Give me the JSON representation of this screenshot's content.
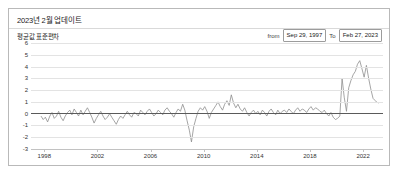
{
  "panel": {
    "title": "2023년 2월 업데이트",
    "subtitle": "평균값 표준편차"
  },
  "date_range": {
    "from_label": "from",
    "from_value": "Sep 29, 1997",
    "to_label": "To",
    "to_value": "Feb 27, 2023"
  },
  "chart_data": {
    "type": "line",
    "title": "평균값 표준편차",
    "xlabel": "",
    "ylabel": "",
    "ylim": [
      -3,
      6
    ],
    "xlim": [
      1997.0,
      2023.5
    ],
    "grid": true,
    "legend": false,
    "yticks": [
      6,
      5,
      4,
      3,
      2,
      1,
      0,
      -1,
      -2,
      -3
    ],
    "xticks": [
      1998,
      2002,
      2006,
      2010,
      2014,
      2018,
      2022
    ],
    "line_color": "#8e8e8e",
    "zero_line_color": "#5a5a5a",
    "series": [
      {
        "name": "평균값 표준편차",
        "x": [
          1997.75,
          1997.92,
          1998.08,
          1998.25,
          1998.42,
          1998.58,
          1998.75,
          1998.92,
          1999.08,
          1999.25,
          1999.42,
          1999.58,
          1999.75,
          1999.92,
          2000.08,
          2000.25,
          2000.42,
          2000.58,
          2000.75,
          2000.92,
          2001.08,
          2001.25,
          2001.42,
          2001.58,
          2001.75,
          2001.92,
          2002.08,
          2002.25,
          2002.42,
          2002.58,
          2002.75,
          2002.92,
          2003.08,
          2003.25,
          2003.42,
          2003.58,
          2003.75,
          2003.92,
          2004.08,
          2004.25,
          2004.42,
          2004.58,
          2004.75,
          2004.92,
          2005.08,
          2005.25,
          2005.42,
          2005.58,
          2005.75,
          2005.92,
          2006.08,
          2006.25,
          2006.42,
          2006.58,
          2006.75,
          2006.92,
          2007.08,
          2007.25,
          2007.42,
          2007.58,
          2007.75,
          2007.92,
          2008.08,
          2008.25,
          2008.42,
          2008.58,
          2008.75,
          2008.92,
          2009.08,
          2009.25,
          2009.42,
          2009.58,
          2009.75,
          2009.92,
          2010.08,
          2010.25,
          2010.42,
          2010.58,
          2010.75,
          2010.92,
          2011.08,
          2011.25,
          2011.42,
          2011.58,
          2011.75,
          2011.92,
          2012.08,
          2012.25,
          2012.42,
          2012.58,
          2012.75,
          2012.92,
          2013.08,
          2013.25,
          2013.42,
          2013.58,
          2013.75,
          2013.92,
          2014.08,
          2014.25,
          2014.42,
          2014.58,
          2014.75,
          2014.92,
          2015.08,
          2015.25,
          2015.42,
          2015.58,
          2015.75,
          2015.92,
          2016.08,
          2016.25,
          2016.42,
          2016.58,
          2016.75,
          2016.92,
          2017.08,
          2017.25,
          2017.42,
          2017.58,
          2017.75,
          2017.92,
          2018.08,
          2018.25,
          2018.42,
          2018.58,
          2018.75,
          2018.92,
          2019.08,
          2019.25,
          2019.42,
          2019.58,
          2019.75,
          2019.92,
          2020.08,
          2020.25,
          2020.42,
          2020.58,
          2020.75,
          2020.92,
          2021.08,
          2021.25,
          2021.42,
          2021.58,
          2021.75,
          2021.92,
          2022.08,
          2022.25,
          2022.42,
          2022.58,
          2022.75,
          2022.92,
          2023.0,
          2023.16
        ],
        "values": [
          -0.2,
          -0.5,
          -0.3,
          -0.7,
          -0.2,
          0.1,
          -0.4,
          -0.2,
          0.2,
          -0.3,
          -0.6,
          -0.2,
          0.1,
          0.3,
          -0.1,
          0.4,
          0.1,
          -0.2,
          0.3,
          -0.1,
          0.2,
          0.5,
          0.1,
          -0.3,
          -0.8,
          -0.4,
          -0.1,
          0.2,
          -0.2,
          -0.5,
          -0.3,
          0.0,
          -0.3,
          -0.6,
          -0.9,
          -0.5,
          -0.2,
          -0.4,
          -0.1,
          0.2,
          -0.1,
          -0.3,
          0.1,
          0.0,
          -0.2,
          0.3,
          0.1,
          -0.1,
          0.2,
          0.4,
          0.1,
          -0.2,
          0.0,
          0.3,
          0.1,
          -0.1,
          0.3,
          0.5,
          0.2,
          0.0,
          -0.3,
          0.1,
          0.4,
          0.2,
          0.8,
          0.3,
          -0.6,
          -1.4,
          -2.4,
          -1.1,
          -0.4,
          0.2,
          0.5,
          0.3,
          0.6,
          0.2,
          -0.4,
          0.1,
          0.4,
          0.7,
          1.0,
          0.6,
          0.3,
          0.8,
          1.1,
          0.7,
          1.6,
          0.9,
          0.5,
          0.8,
          0.4,
          0.2,
          0.5,
          0.1,
          -0.2,
          0.1,
          0.3,
          0.0,
          0.2,
          -0.1,
          0.3,
          0.1,
          -0.2,
          0.2,
          0.4,
          0.1,
          -0.1,
          0.3,
          0.0,
          0.2,
          0.3,
          0.1,
          0.4,
          0.2,
          0.0,
          0.3,
          0.5,
          0.2,
          0.4,
          0.3,
          0.1,
          0.4,
          0.6,
          0.3,
          0.5,
          0.4,
          0.2,
          0.1,
          0.3,
          0.0,
          -0.2,
          0.1,
          -0.3,
          -0.5,
          -0.4,
          -0.2,
          3.0,
          1.4,
          0.2,
          2.2,
          2.8,
          3.3,
          3.6,
          4.2,
          4.5,
          3.8,
          3.1,
          4.1,
          3.0,
          2.1,
          1.3,
          1.1,
          1.0,
          0.9
        ]
      }
    ]
  }
}
